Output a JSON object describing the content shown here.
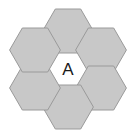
{
  "figure": {
    "name": "hexagon-cluster-diagram",
    "background_color": "#ffffff",
    "width": 136,
    "height": 138
  },
  "style": {
    "ring_fill": "#c8c8c8",
    "center_fill": "#ffffff",
    "stroke": "#9a9a9a",
    "label_color": "#1a1a1a",
    "stroke_width": 1
  },
  "geometry": {
    "center_x": 68,
    "center_y": 69,
    "apothem": 22.0,
    "circumradius": 25.4,
    "orientation": "flat-top"
  },
  "cells": [
    {
      "id": "center",
      "position": "center",
      "label": "A",
      "fill": "#ffffff",
      "cx": 68,
      "cy": 69
    },
    {
      "id": "top",
      "position": "top",
      "label": "",
      "fill": "#c8c8c8",
      "cx": 68,
      "cy": 31
    },
    {
      "id": "upper-right",
      "position": "upper-right",
      "label": "",
      "fill": "#c8c8c8",
      "cx": 101,
      "cy": 50
    },
    {
      "id": "lower-right",
      "position": "lower-right",
      "label": "",
      "fill": "#c8c8c8",
      "cx": 101,
      "cy": 88
    },
    {
      "id": "bottom",
      "position": "bottom",
      "label": "",
      "fill": "#c8c8c8",
      "cx": 68,
      "cy": 107
    },
    {
      "id": "lower-left",
      "position": "lower-left",
      "label": "",
      "fill": "#c8c8c8",
      "cx": 35,
      "cy": 88
    },
    {
      "id": "upper-left",
      "position": "upper-left",
      "label": "",
      "fill": "#c8c8c8",
      "cx": 35,
      "cy": 50
    }
  ]
}
